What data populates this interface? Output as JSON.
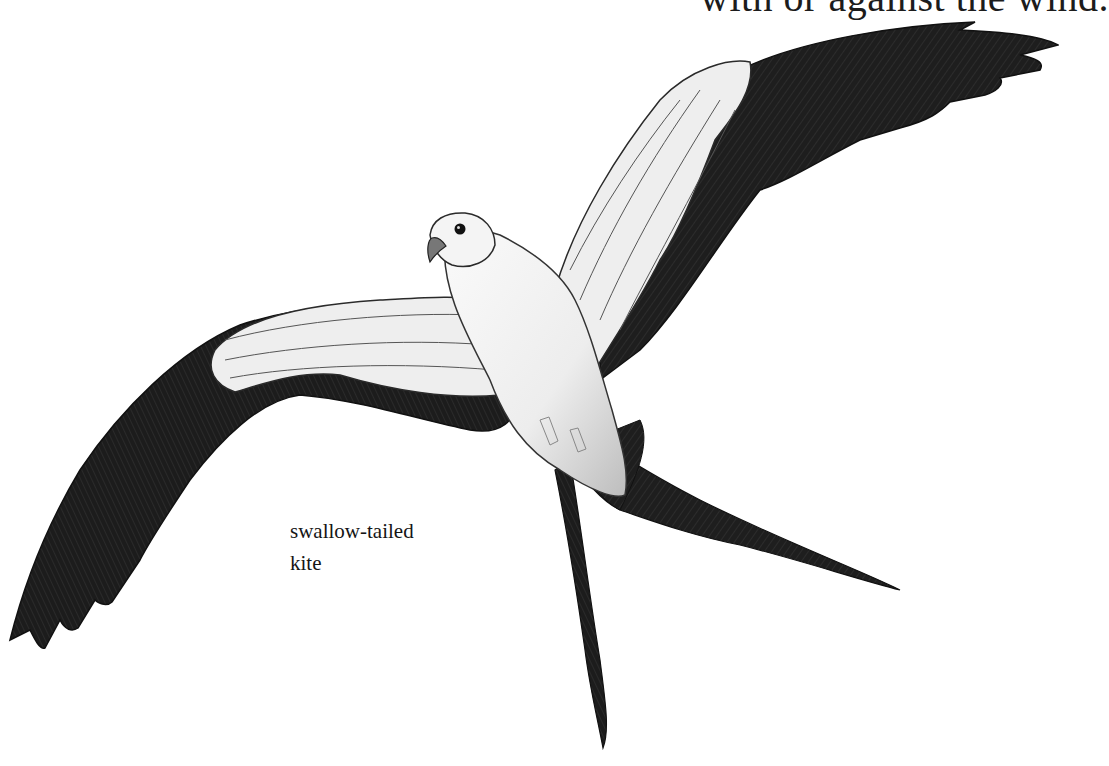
{
  "page": {
    "top_text": "with or against the wind.",
    "caption": {
      "line1": "swallow-tailed",
      "line2": "kite"
    }
  },
  "illustration": {
    "subject": "swallow-tailed kite in flight",
    "style": "pencil drawing, grayscale",
    "colors": {
      "background": "#ffffff",
      "flight_feathers": "#1e1e1e",
      "body": "#f2f2f2",
      "coverts": "#e6e6e6",
      "outline": "#2a2a2a"
    }
  }
}
